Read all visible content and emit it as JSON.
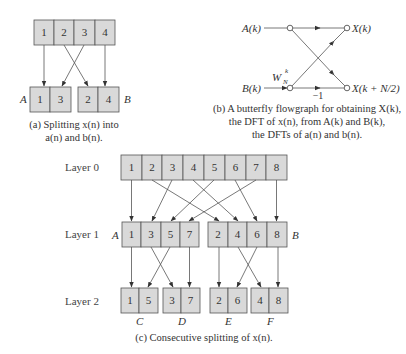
{
  "figure_a": {
    "top_row": [
      "1",
      "2",
      "3",
      "4"
    ],
    "group_a_label": "A",
    "group_a": [
      "1",
      "3"
    ],
    "group_b_label": "B",
    "group_b": [
      "2",
      "4"
    ],
    "caption_line1": "(a) Splitting x(n) into",
    "caption_line2": "a(n) and b(n)."
  },
  "figure_b": {
    "input_top": "A(k)",
    "input_bottom": "B(k)",
    "output_top": "X(k)",
    "output_bottom": "X(k + N/2)",
    "twiddle": "W",
    "twiddle_sub": "N",
    "twiddle_sup": "k",
    "minus_one": "−1",
    "caption_line1": "(b) A butterfly flowgraph for obtaining X(k),",
    "caption_line2": "the DFT of x(n), from A(k) and B(k),",
    "caption_line3": "the DFTs of a(n) and b(n)."
  },
  "figure_c": {
    "layer0_label": "Layer 0",
    "layer1_label": "Layer 1",
    "layer2_label": "Layer 2",
    "layer0": [
      "1",
      "2",
      "3",
      "4",
      "5",
      "6",
      "7",
      "8"
    ],
    "layer1_a_label": "A",
    "layer1_a": [
      "1",
      "3",
      "5",
      "7"
    ],
    "layer1_b_label": "B",
    "layer1_b": [
      "2",
      "4",
      "6",
      "8"
    ],
    "layer2_groups": [
      {
        "label": "C",
        "cells": [
          "1",
          "5"
        ]
      },
      {
        "label": "D",
        "cells": [
          "3",
          "7"
        ]
      },
      {
        "label": "E",
        "cells": [
          "2",
          "6"
        ]
      },
      {
        "label": "F",
        "cells": [
          "4",
          "8"
        ]
      }
    ],
    "caption": "(c) Consecutive splitting of x(n)."
  }
}
